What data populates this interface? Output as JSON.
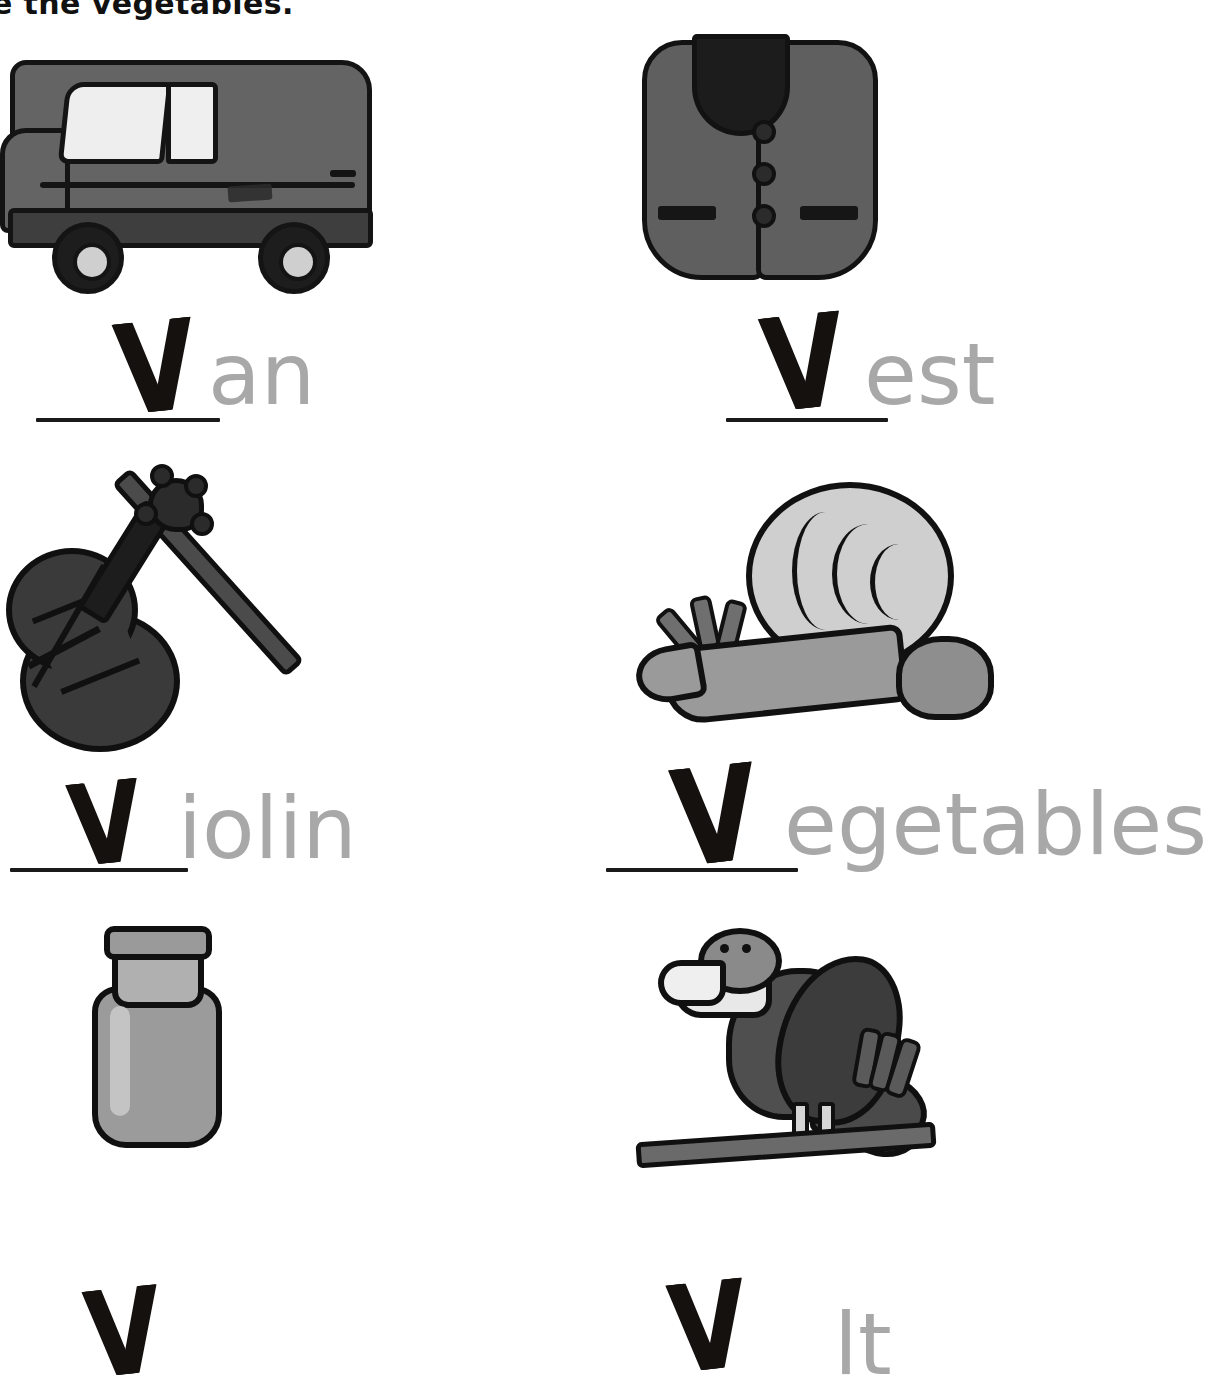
{
  "worksheet": {
    "title": "e the vegetables.",
    "letter": "V",
    "blank_mark": "_____"
  },
  "items": [
    {
      "id": "van",
      "picture": "van-illustration",
      "letter": "V",
      "word_remainder": "an",
      "full_word": "van",
      "column": "left",
      "row": 1
    },
    {
      "id": "vest",
      "picture": "vest-illustration",
      "letter": "V",
      "word_remainder": "est",
      "full_word": "vest",
      "column": "right",
      "row": 1
    },
    {
      "id": "violin",
      "picture": "violin-illustration",
      "letter": "V",
      "word_remainder": "iolin",
      "full_word": "violin",
      "column": "left",
      "row": 2
    },
    {
      "id": "vegetables",
      "picture": "vegetables-illustration",
      "letter": "V",
      "word_remainder": "egetables",
      "full_word": "vegetables",
      "column": "right",
      "row": 2
    },
    {
      "id": "vase",
      "picture": "vase-illustration",
      "letter": "V",
      "word_remainder": "",
      "full_word": "vase",
      "column": "left",
      "row": 3
    },
    {
      "id": "vulture",
      "picture": "vulture-illustration",
      "letter": "V",
      "word_remainder": "lt",
      "full_word": "vulture",
      "column": "right",
      "row": 3
    }
  ],
  "colors": {
    "ink": "#151515",
    "traced_letter": "#15110f",
    "printed_word": "#a8a8a8",
    "paper": "#ffffff"
  }
}
